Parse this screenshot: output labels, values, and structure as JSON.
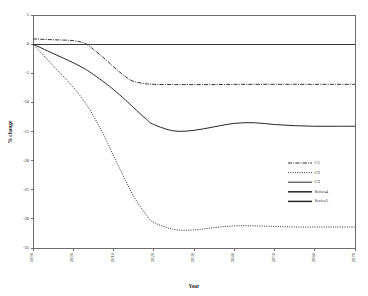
{
  "chart_data": {
    "type": "line",
    "title": "",
    "xlabel": "Year",
    "ylabel": "% change",
    "xlim": [
      1990,
      2070
    ],
    "ylim": [
      -35,
      5
    ],
    "grid": false,
    "legend_position": "center-right",
    "xticks": [
      "1990",
      "2000",
      "2010",
      "2020",
      "2030",
      "2040",
      "2050",
      "2060",
      "2070"
    ],
    "yticks": [
      "5",
      "0",
      "-5",
      "-10",
      "-15",
      "-20",
      "-25",
      "-30",
      "-35"
    ],
    "x": [
      1990,
      1995,
      2000,
      2003,
      2005,
      2008,
      2010,
      2013,
      2015,
      2018,
      2020,
      2025,
      2030,
      2035,
      2040,
      2045,
      2050,
      2055,
      2060,
      2065,
      2070
    ],
    "series": [
      {
        "name": "C1",
        "style": "dash-dot",
        "values": [
          0.9,
          0.75,
          0.6,
          0.1,
          -0.9,
          -2.6,
          -3.9,
          -5.6,
          -6.4,
          -6.8,
          -6.9,
          -6.95,
          -6.95,
          -6.95,
          -6.9,
          -6.9,
          -6.9,
          -6.9,
          -6.9,
          -6.9,
          -6.9
        ]
      },
      {
        "name": "C2",
        "style": "dotted",
        "values": [
          0.0,
          -3.7,
          -7.4,
          -10.1,
          -12.3,
          -16.2,
          -19.2,
          -23.4,
          -26.1,
          -29.2,
          -30.6,
          -31.8,
          -31.9,
          -31.5,
          -31.2,
          -31.2,
          -31.3,
          -31.4,
          -31.4,
          -31.4,
          -31.4
        ]
      },
      {
        "name": "C3",
        "style": "solid",
        "values": [
          0.0,
          -1.6,
          -3.2,
          -4.3,
          -5.2,
          -6.7,
          -7.8,
          -9.6,
          -10.9,
          -12.8,
          -13.8,
          -14.9,
          -14.8,
          -14.2,
          -13.6,
          -13.5,
          -13.8,
          -14.0,
          -14.1,
          -14.1,
          -14.1
        ]
      }
    ],
    "legend_entries": [
      {
        "label": "C1",
        "style": "dash-dot"
      },
      {
        "label": "C2",
        "style": "dotted"
      },
      {
        "label": "C3",
        "style": "solid"
      },
      {
        "label": "Series4",
        "style": "solid-thick"
      },
      {
        "label": "Series5",
        "style": "solid-thick"
      }
    ]
  }
}
